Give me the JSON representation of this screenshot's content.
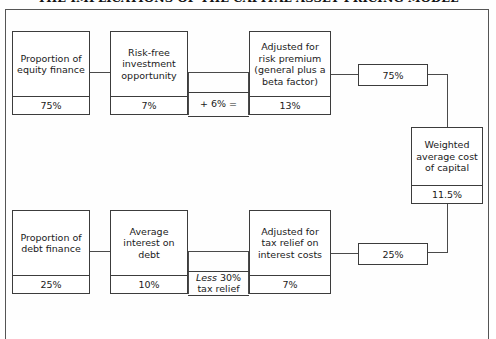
{
  "title": "THE IMPLICATIONS OF THE CAPITAL ASSET PRICING MODEL",
  "colors": {
    "box_border": "#3c3c3c",
    "frame_border": "#555555",
    "connector": "#4a4a4a",
    "background": "#ffffff",
    "text": "#1a1a1a"
  },
  "diagram": {
    "type": "flow-diagram",
    "equity_row": {
      "proportion": {
        "label": "Proportion of equity finance",
        "value": "75%"
      },
      "risk_free": {
        "label": "Risk-free investment opportunity",
        "value": "7%"
      },
      "operator": "+ 6% =",
      "adjusted": {
        "label": "Adjusted for risk premium (general plus a beta factor)",
        "value": "13%"
      },
      "weighting": "75%"
    },
    "debt_row": {
      "proportion": {
        "label": "Proportion of debt finance",
        "value": "25%"
      },
      "average_interest": {
        "label": "Average interest on debt",
        "value": "10%"
      },
      "operator_prefix": "Less",
      "operator_suffix": " 30% tax relief",
      "adjusted": {
        "label": "Adjusted for tax relief on interest costs",
        "value": "7%"
      },
      "weighting": "25%"
    },
    "result": {
      "label": "Weighted average cost of capital",
      "value": "11.5%"
    }
  }
}
